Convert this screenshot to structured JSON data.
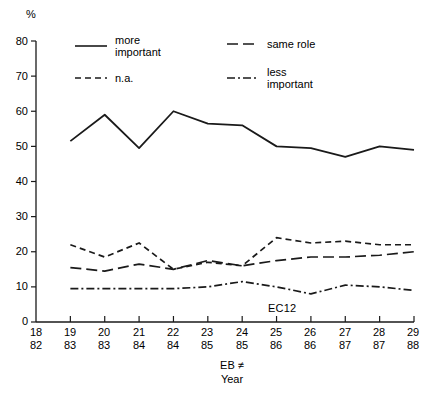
{
  "chart_data": {
    "type": "line",
    "title": "",
    "subtitle": "",
    "ylabel": "%",
    "xlabel": "EB ≠\nYear",
    "xlabel_line1": "EB ≠",
    "xlabel_line2": "Year",
    "ylim": [
      0,
      80
    ],
    "yticks": [
      0,
      10,
      20,
      30,
      40,
      50,
      60,
      70,
      80
    ],
    "ytick_labels": [
      "0",
      "10",
      "20",
      "30",
      "40",
      "50",
      "60",
      "70",
      "80"
    ],
    "grid": false,
    "legend_position": "top-center",
    "categories": [
      "18",
      "19",
      "20",
      "21",
      "22",
      "23",
      "24",
      "25",
      "26",
      "27",
      "28",
      "29"
    ],
    "x_secondary": [
      "82",
      "83",
      "83",
      "84",
      "84",
      "85",
      "85",
      "86",
      "86",
      "87",
      "87",
      "88"
    ],
    "x_ticks": [
      {
        "eb": "18",
        "year": "82"
      },
      {
        "eb": "19",
        "year": "83"
      },
      {
        "eb": "20",
        "year": "83"
      },
      {
        "eb": "21",
        "year": "84"
      },
      {
        "eb": "22",
        "year": "84"
      },
      {
        "eb": "23",
        "year": "85"
      },
      {
        "eb": "24",
        "year": "85"
      },
      {
        "eb": "25",
        "year": "86"
      },
      {
        "eb": "26",
        "year": "86"
      },
      {
        "eb": "27",
        "year": "87"
      },
      {
        "eb": "28",
        "year": "87"
      },
      {
        "eb": "29",
        "year": "88"
      }
    ],
    "annotations": [
      {
        "text": "EC12",
        "x_category": "25",
        "y": 4
      }
    ],
    "series": [
      {
        "name": "more important",
        "label": "more\nimportant",
        "style": "solid",
        "x": [
          "19",
          "20",
          "21",
          "22",
          "23",
          "24",
          "25",
          "26",
          "27",
          "28",
          "29"
        ],
        "values": [
          51.5,
          59,
          49.5,
          60,
          56.5,
          56,
          50,
          49.5,
          47,
          50,
          49
        ]
      },
      {
        "name": "same role",
        "label": "same role",
        "style": "long-dash",
        "x": [
          "19",
          "20",
          "21",
          "22",
          "23",
          "24",
          "25",
          "26",
          "27",
          "28",
          "29"
        ],
        "values": [
          15.5,
          14.5,
          16.5,
          15,
          17.5,
          16,
          17.5,
          18.5,
          18.5,
          19,
          20
        ]
      },
      {
        "name": "n.a.",
        "label": "n.a.",
        "style": "short-dash",
        "x": [
          "19",
          "20",
          "21",
          "22",
          "23",
          "24",
          "25",
          "26",
          "27",
          "28",
          "29"
        ],
        "values": [
          22,
          18.5,
          22.5,
          15,
          17,
          16,
          24,
          22.5,
          23,
          22,
          22
        ]
      },
      {
        "name": "less important",
        "label": "less\nimportant",
        "style": "dash-dot",
        "x": [
          "19",
          "20",
          "21",
          "22",
          "23",
          "24",
          "25",
          "26",
          "27",
          "28",
          "29"
        ],
        "values": [
          9.5,
          9.5,
          9.5,
          9.5,
          10,
          11.5,
          10,
          8,
          10.5,
          10,
          9
        ]
      }
    ],
    "colors": {
      "line": "#1a1a1a",
      "axis": "#1a1a1a",
      "background": "#ffffff"
    }
  },
  "legend": {
    "entries": [
      {
        "label": "more\nimportant",
        "style": "solid"
      },
      {
        "label": "same role",
        "style": "long-dash"
      },
      {
        "label": "n.a.",
        "style": "short-dash"
      },
      {
        "label": "less\nimportant",
        "style": "dash-dot"
      }
    ]
  }
}
